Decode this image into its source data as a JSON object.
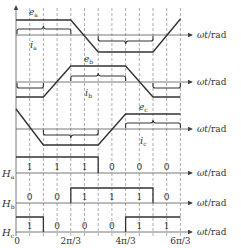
{
  "figure": {
    "type": "BLDC back-EMF, phase current and Hall signal waveforms",
    "axis_label": "ωt/rad",
    "x_ticks": [
      "0",
      "2π/3",
      "4π/3",
      "6π/3"
    ],
    "phases": [
      {
        "name": "a",
        "emf_label": "e",
        "emf_sub": "a",
        "current_label": "i",
        "current_sub": "a"
      },
      {
        "name": "b",
        "emf_label": "e",
        "emf_sub": "b",
        "current_label": "i",
        "current_sub": "b"
      },
      {
        "name": "c",
        "emf_label": "e",
        "emf_sub": "c",
        "current_label": "i",
        "current_sub": "c"
      }
    ],
    "hall": [
      {
        "label": "H",
        "sub": "a",
        "values": [
          "1",
          "1",
          "1",
          "0",
          "0",
          "0"
        ]
      },
      {
        "label": "H",
        "sub": "b",
        "values": [
          "0",
          "0",
          "1",
          "1",
          "1",
          "0"
        ]
      },
      {
        "label": "H",
        "sub": "c",
        "values": [
          "1",
          "0",
          "0",
          "0",
          "1",
          "1"
        ]
      }
    ]
  }
}
